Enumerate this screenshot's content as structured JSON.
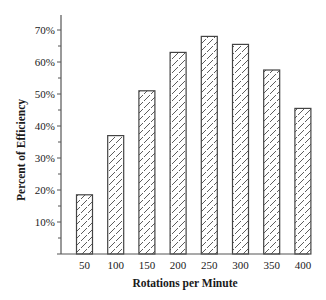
{
  "chart_data": {
    "type": "bar",
    "title": "",
    "xlabel": "Rotations per Minute",
    "ylabel": "Percent of Efficiency",
    "categories": [
      "50",
      "100",
      "150",
      "200",
      "250",
      "300",
      "350",
      "400"
    ],
    "values": [
      18.5,
      37,
      51,
      63,
      68,
      65.5,
      57.5,
      45.5
    ],
    "ylim": [
      0,
      75
    ],
    "yticks": [
      10,
      20,
      30,
      40,
      50,
      60,
      70
    ],
    "ytick_labels": [
      "10%",
      "20%",
      "30%",
      "40%",
      "50%",
      "60%",
      "70%"
    ],
    "minor_yticks": [
      5,
      15,
      25,
      35,
      45,
      55,
      65
    ],
    "grid": false,
    "legend": null,
    "bar_style": "diagonal hatch, dark outline, white fill"
  },
  "colors": {
    "axis": "#555555",
    "bar_outline": "#444444",
    "hatch": "#333333",
    "background": "#ffffff"
  }
}
